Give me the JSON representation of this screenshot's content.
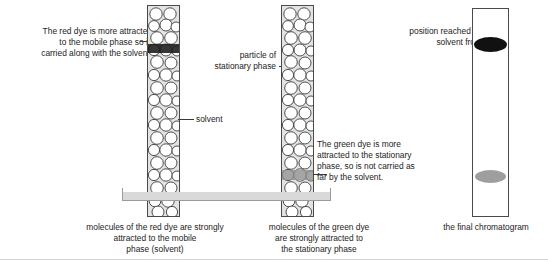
{
  "diagram": {
    "background_color": "#ffffff"
  },
  "annotations": {
    "red_dye_note": "The red dye is more attracted\nto the mobile phase so is\ncarried along with the solvent.",
    "solvent_label": "solvent",
    "stationary_particle_label": "particle of\nstationary phase",
    "green_dye_note": "The green dye is more\nattracted to the stationary\nphase, so is not carried as\nfar by the solvent.",
    "solvent_front_label": "position reached by\nsolvent front"
  },
  "captions": {
    "red_caption": "molecules of the red dye are strongly\nattracted to the mobile\nphase (solvent)",
    "green_caption": "molecules of the green dye\nare strongly attracted to\nthe stationary phase",
    "chromatogram_caption": "the final chromatogram"
  },
  "columns": [
    {
      "name": "red-dye-column",
      "band_label": "red dye band",
      "band_color": "#1a1a1a",
      "band_position_percent": 21,
      "fill_color": "#e3e3e3",
      "border_color": "#4a4a4a"
    },
    {
      "name": "green-dye-column",
      "band_label": "green dye band",
      "band_color": "#8e8e8e",
      "band_position_percent": 83,
      "fill_color": "#e3e3e3",
      "border_color": "#4a4a4a"
    }
  ],
  "chromatogram": {
    "name": "final-chromatogram",
    "spots": [
      {
        "label": "solvent front spot",
        "color": "#111111",
        "position_percent": 17
      },
      {
        "label": "green dye spot",
        "color": "#9e9e9e",
        "position_percent": 80
      }
    ]
  },
  "colors": {
    "ink": "#1c1c1c",
    "line": "#3a3a3a",
    "column_fill": "#e3e3e3",
    "trough": "#d9d9d9",
    "dark_spot": "#111111",
    "grey_spot": "#9e9e9e"
  }
}
